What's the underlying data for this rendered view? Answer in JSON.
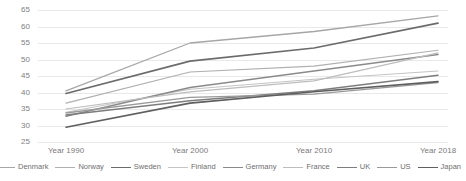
{
  "chart_data": {
    "type": "line",
    "title": "",
    "xlabel": "",
    "ylabel": "",
    "categories": [
      "Year 1990",
      "Year 2000",
      "Year 2010",
      "Year 2018"
    ],
    "ylim": [
      25,
      65
    ],
    "yticks": [
      25,
      30,
      35,
      40,
      45,
      50,
      55,
      60,
      65
    ],
    "grid": true,
    "legend_position": "bottom",
    "series": [
      {
        "name": "Denmark",
        "values": [
          40.5,
          55.0,
          58.5,
          63.2
        ],
        "color": "#a6a6a6",
        "width": 1.3
      },
      {
        "name": "Norway",
        "values": [
          36.8,
          46.2,
          48.0,
          52.8
        ],
        "color": "#b0b0b0",
        "width": 1.1
      },
      {
        "name": "Sweden",
        "values": [
          39.7,
          49.5,
          53.5,
          61.0
        ],
        "color": "#6b6b6b",
        "width": 1.7
      },
      {
        "name": "Finland",
        "values": [
          34.0,
          41.0,
          44.0,
          46.5
        ],
        "color": "#c4c4c4",
        "width": 1.1
      },
      {
        "name": "Germany",
        "values": [
          32.8,
          41.5,
          46.5,
          51.5
        ],
        "color": "#8a8a8a",
        "width": 1.5
      },
      {
        "name": "France",
        "values": [
          35.0,
          40.2,
          43.5,
          52.0
        ],
        "color": "#bdbdbd",
        "width": 1.2
      },
      {
        "name": "UK",
        "values": [
          33.2,
          37.5,
          40.5,
          45.2
        ],
        "color": "#7d7d7d",
        "width": 1.5
      },
      {
        "name": "US",
        "values": [
          33.8,
          38.5,
          39.5,
          43.0
        ],
        "color": "#9a9a9a",
        "width": 1.3
      },
      {
        "name": "Japan",
        "values": [
          29.5,
          36.8,
          40.2,
          43.3
        ],
        "color": "#5f5f5f",
        "width": 1.6
      }
    ]
  },
  "axis": {
    "y_labels": [
      "65",
      "60",
      "55",
      "50",
      "45",
      "40",
      "35",
      "30",
      "25"
    ],
    "x_labels": [
      "Year 1990",
      "Year 2000",
      "Year 2010",
      "Year 2018"
    ]
  },
  "legend": {
    "items": [
      {
        "label": "Denmark",
        "color": "#a6a6a6",
        "width": "1.3px"
      },
      {
        "label": "Norway",
        "color": "#b0b0b0",
        "width": "1.1px"
      },
      {
        "label": "Sweden",
        "color": "#6b6b6b",
        "width": "1.8px"
      },
      {
        "label": "Finland",
        "color": "#c4c4c4",
        "width": "1.1px"
      },
      {
        "label": "Germany",
        "color": "#8a8a8a",
        "width": "1.5px"
      },
      {
        "label": "France",
        "color": "#bdbdbd",
        "width": "1.2px"
      },
      {
        "label": "UK",
        "color": "#7d7d7d",
        "width": "1.6px"
      },
      {
        "label": "US",
        "color": "#9a9a9a",
        "width": "1.4px"
      },
      {
        "label": "Japan",
        "color": "#5f5f5f",
        "width": "1.7px"
      }
    ]
  }
}
